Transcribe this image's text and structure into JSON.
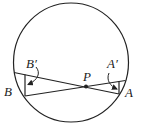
{
  "diagram": {
    "type": "geometry",
    "colors": {
      "stroke": "#222222",
      "background": "#ffffff"
    },
    "circle": {
      "cx": 71,
      "cy": 62.5,
      "rx": 57.5,
      "ry": 59.5
    },
    "points": {
      "P": {
        "x": 86,
        "y": 86.5
      },
      "B": {
        "x": 25,
        "y": 96
      },
      "A": {
        "x": 119,
        "y": 94
      },
      "B_prime": {
        "x": 25,
        "y": 74
      },
      "A_prime": {
        "x": 119,
        "y": 81.5
      }
    },
    "labels": {
      "B_prime": "B′",
      "B": "B",
      "P": "P",
      "A_prime": "A′",
      "A": "A"
    }
  }
}
